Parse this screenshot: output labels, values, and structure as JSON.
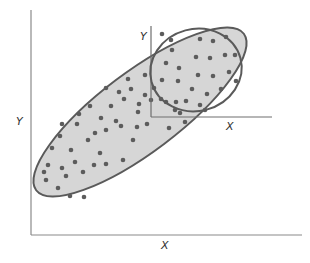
{
  "diagram": {
    "colors": {
      "background": "#ffffff",
      "ellipse_fill": "#d6d6d6",
      "ellipse_stroke": "#5a5a5a",
      "axis": "#8a8a8a",
      "dot": "#5c5c5c"
    },
    "outer_axes": {
      "x_label": "X",
      "y_label": "Y"
    },
    "inner_axes": {
      "x_label": "X",
      "y_label": "Y"
    },
    "big_ellipse": {
      "cx": 140,
      "cy": 112,
      "rx": 130,
      "ry": 40,
      "rotation": -37
    },
    "small_ellipse": {
      "cx": 196,
      "cy": 70,
      "rx": 46,
      "ry": 41,
      "rotation": -15
    },
    "dots_outer": [
      [
        46,
        180
      ],
      [
        58,
        188
      ],
      [
        48,
        165
      ],
      [
        62,
        168
      ],
      [
        52,
        148
      ],
      [
        71,
        150
      ],
      [
        75,
        162
      ],
      [
        66,
        176
      ],
      [
        83,
        172
      ],
      [
        94,
        165
      ],
      [
        70,
        196
      ],
      [
        84,
        197
      ],
      [
        88,
        140
      ],
      [
        100,
        153
      ],
      [
        106,
        164
      ],
      [
        95,
        133
      ],
      [
        106,
        130
      ],
      [
        123,
        160
      ],
      [
        133,
        140
      ],
      [
        116,
        121
      ],
      [
        62,
        124
      ],
      [
        77,
        124
      ],
      [
        79,
        114
      ],
      [
        90,
        106
      ],
      [
        101,
        118
      ],
      [
        111,
        106
      ],
      [
        121,
        126
      ],
      [
        119,
        92
      ],
      [
        131,
        89
      ],
      [
        138,
        112
      ],
      [
        137,
        127
      ],
      [
        147,
        124
      ],
      [
        106,
        88
      ],
      [
        128,
        79
      ],
      [
        145,
        95
      ],
      [
        151,
        100
      ],
      [
        166,
        102
      ],
      [
        169,
        128
      ],
      [
        185,
        122
      ],
      [
        205,
        110
      ],
      [
        180,
        113
      ],
      [
        145,
        75
      ],
      [
        154,
        88
      ],
      [
        124,
        99
      ],
      [
        139,
        104
      ],
      [
        60,
        136
      ],
      [
        44,
        172
      ]
    ],
    "dots_inner": [
      [
        162,
        34
      ],
      [
        171,
        40
      ],
      [
        200,
        39
      ],
      [
        213,
        41
      ],
      [
        226,
        37
      ],
      [
        172,
        50
      ],
      [
        196,
        57
      ],
      [
        210,
        58
      ],
      [
        225,
        55
      ],
      [
        235,
        55
      ],
      [
        166,
        63
      ],
      [
        179,
        68
      ],
      [
        198,
        75
      ],
      [
        213,
        76
      ],
      [
        229,
        72
      ],
      [
        236,
        81
      ],
      [
        162,
        80
      ],
      [
        178,
        81
      ],
      [
        192,
        89
      ],
      [
        207,
        94
      ],
      [
        221,
        89
      ],
      [
        161,
        99
      ],
      [
        176,
        102
      ],
      [
        186,
        101
      ],
      [
        200,
        105
      ],
      [
        175,
        110
      ]
    ]
  }
}
